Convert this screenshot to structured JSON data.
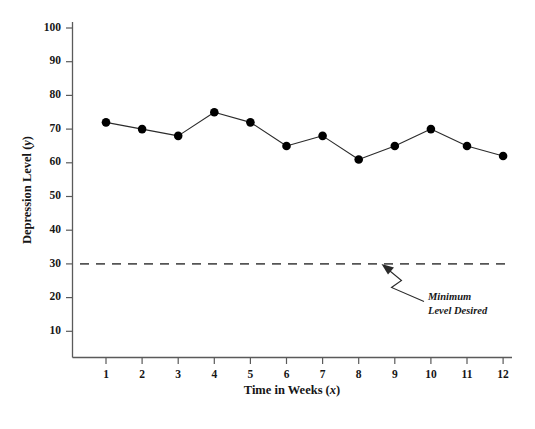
{
  "chart_data": {
    "type": "line",
    "title": "",
    "subtitle": "",
    "xlabel_text": "Time in Weeks (",
    "xlabel_italic": "x",
    "xlabel_tail": ")",
    "ylabel_text": "Depression Level (",
    "ylabel_italic": "y",
    "ylabel_tail": ")",
    "x": [
      1,
      2,
      3,
      4,
      5,
      6,
      7,
      8,
      9,
      10,
      11,
      12
    ],
    "values": [
      72,
      70,
      68,
      75,
      72,
      65,
      68,
      61,
      65,
      70,
      65,
      62
    ],
    "series": [
      {
        "name": "Depression Level",
        "values": [
          72,
          70,
          68,
          75,
          72,
          65,
          68,
          61,
          65,
          70,
          65,
          62
        ]
      }
    ],
    "xticklabels": [
      "1",
      "2",
      "3",
      "4",
      "5",
      "6",
      "7",
      "8",
      "9",
      "10",
      "11",
      "12"
    ],
    "yticklabels": [
      "10",
      "20",
      "30",
      "40",
      "50",
      "60",
      "70",
      "80",
      "90",
      "100"
    ],
    "yticks": [
      10,
      20,
      30,
      40,
      50,
      60,
      70,
      80,
      90,
      100
    ],
    "xlim": [
      0.45,
      12.55
    ],
    "ylim": [
      0,
      103
    ],
    "grid": false,
    "legend": false,
    "legend_position": "none",
    "marker": "circle",
    "marker_color": "#000000",
    "line_color": "#2b2b2b",
    "background_color": "#ffffff",
    "annotations": [
      {
        "name": "threshold",
        "kind": "hline",
        "y": 30,
        "style": "dashed",
        "color": "#555555",
        "label_line1": "Minimum",
        "label_line2": "Level Desired"
      }
    ]
  }
}
